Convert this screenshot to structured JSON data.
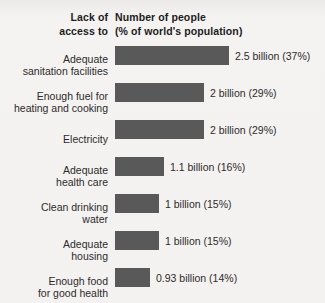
{
  "header": {
    "left_line1": "Lack of",
    "left_line2": "access to",
    "right_line1": "Number of people",
    "right_line2": "(% of world's population)"
  },
  "chart_data": {
    "type": "bar",
    "orientation": "horizontal",
    "title": "",
    "xlabel": "Number of people (% of world's population)",
    "ylabel": "Lack of access to",
    "grid": false,
    "legend": null,
    "units": "billions of people",
    "categories": [
      "Adequate sanitation facilities",
      "Enough fuel for heating and cooking",
      "Electricity",
      "Adequate health care",
      "Clean drinking water",
      "Adequate housing",
      "Enough food for good health"
    ],
    "values": [
      2.5,
      2,
      2,
      1.1,
      1,
      1,
      0.93
    ],
    "percents": [
      37,
      29,
      29,
      16,
      15,
      15,
      14
    ],
    "value_labels": [
      "2.5 billion (37%)",
      "2 billion (29%)",
      "2 billion (29%)",
      "1.1 billion (16%)",
      "1 billion (15%)",
      "1 billion (15%)",
      "0.93 billion (14%)"
    ],
    "xlim": [
      0,
      2.5
    ]
  },
  "rows": [
    {
      "label": "Adequate\nsanitation facilities",
      "value_label": "2.5 billion (37%)",
      "bar_width_px": 114
    },
    {
      "label": "Enough fuel for\nheating and cooking",
      "value_label": "2 billion (29%)",
      "bar_width_px": 89
    },
    {
      "label": "Electricity",
      "value_label": "2 billion (29%)",
      "bar_width_px": 89
    },
    {
      "label": "Adequate\nhealth care",
      "value_label": "1.1 billion (16%)",
      "bar_width_px": 49
    },
    {
      "label": "Clean drinking\nwater",
      "value_label": "1 billion (15%)",
      "bar_width_px": 44
    },
    {
      "label": "Adequate\nhousing",
      "value_label": "1 billion (15%)",
      "bar_width_px": 44
    },
    {
      "label": "Enough food\nfor good health",
      "value_label": "0.93 billion (14%)",
      "bar_width_px": 35
    }
  ],
  "colors": {
    "bar": "#595959",
    "text": "#2b2b2b",
    "heading": "#1c1c1c",
    "background": "#f4f2f0"
  }
}
